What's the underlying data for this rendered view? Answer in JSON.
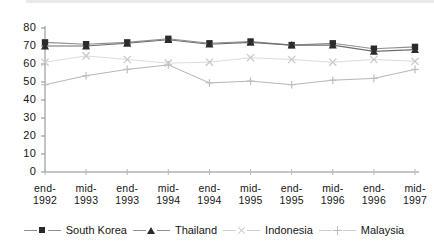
{
  "chart_data": {
    "type": "line",
    "title": "",
    "xlabel": "",
    "ylabel": "",
    "ylim": [
      0,
      80
    ],
    "ytick_step": 10,
    "yticks": [
      "0",
      "10",
      "20",
      "30",
      "40",
      "50",
      "60",
      "70",
      "80"
    ],
    "grid": false,
    "legend_position": "bottom",
    "categories": [
      "end-1992",
      "mid-1993",
      "end-1993",
      "mid-1994",
      "end-1994",
      "mid-1995",
      "end-1995",
      "mid-1996",
      "end-1996",
      "mid-1997"
    ],
    "category_lines": [
      [
        "end-",
        "1992"
      ],
      [
        "mid-",
        "1993"
      ],
      [
        "end-",
        "1993"
      ],
      [
        "mid-",
        "1994"
      ],
      [
        "end-",
        "1994"
      ],
      [
        "mid-",
        "1995"
      ],
      [
        "end-",
        "1995"
      ],
      [
        "mid-",
        "1996"
      ],
      [
        "end-",
        "1996"
      ],
      [
        "mid-",
        "1997"
      ]
    ],
    "series": [
      {
        "name": "South Korea",
        "marker": "square",
        "color": "#2b2b2b",
        "line_color": "#8f8f8f",
        "values": [
          72,
          71,
          72,
          74,
          71.5,
          72.5,
          70.5,
          71.5,
          68.5,
          69.5
        ]
      },
      {
        "name": "Thailand",
        "marker": "triangle",
        "color": "#2b2b2b",
        "line_color": "#6e6e6e",
        "values": [
          70,
          70,
          71.5,
          73.5,
          71,
          72,
          70.5,
          70.5,
          67,
          68
        ]
      },
      {
        "name": "Indonesia",
        "marker": "cross",
        "color": "#c9c9c9",
        "line_color": "#dcdcdc",
        "values": [
          61,
          64.5,
          62.5,
          60.5,
          61,
          63.5,
          62.5,
          61,
          62.5,
          61.5
        ]
      },
      {
        "name": "Malaysia",
        "marker": "plus",
        "color": "#bdbdbd",
        "line_color": "#b5b5b5",
        "values": [
          48.5,
          53.5,
          57,
          59.5,
          49.5,
          50.5,
          48.5,
          51,
          52,
          57
        ]
      }
    ]
  },
  "legend": {
    "items": [
      {
        "label": "South Korea"
      },
      {
        "label": "Thailand"
      },
      {
        "label": "Indonesia"
      },
      {
        "label": "Malaysia"
      }
    ]
  }
}
